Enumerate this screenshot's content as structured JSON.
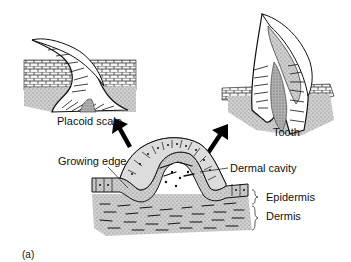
{
  "figure": {
    "panel_label": "(a)",
    "labels": {
      "placoid_scale": "Placoid scale",
      "tooth": "Tooth",
      "growing_edge": "Growing edge",
      "dermal_cavity": "Dermal cavity",
      "epidermis": "Epidermis",
      "dermis": "Dermis"
    },
    "colors": {
      "stipple": "#b8b8b8",
      "dermis_fill": "#a9a9a9",
      "line": "#111111",
      "arrow": "#000000"
    }
  }
}
